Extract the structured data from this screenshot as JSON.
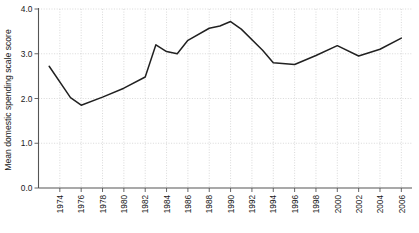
{
  "chart_data": {
    "type": "line",
    "title": "",
    "xlabel": "",
    "ylabel": "Mean domestic spending scale score",
    "ylim": [
      0.0,
      4.0
    ],
    "xlim": [
      1972,
      2007
    ],
    "grid": true,
    "legend": "none",
    "ytick_labels": [
      "0.0",
      "1.0",
      "2.0",
      "3.0",
      "4.0"
    ],
    "ytick_values": [
      0.0,
      1.0,
      2.0,
      3.0,
      4.0
    ],
    "xtick_labels": [
      "1974",
      "1976",
      "1978",
      "1980",
      "1982",
      "1984",
      "1986",
      "1988",
      "1990",
      "1992",
      "1994",
      "1996",
      "1998",
      "2000",
      "2002",
      "2004",
      "2006"
    ],
    "xtick_values": [
      1974,
      1976,
      1978,
      1980,
      1982,
      1984,
      1986,
      1988,
      1990,
      1992,
      1994,
      1996,
      1998,
      2000,
      2002,
      2004,
      2006
    ],
    "x": [
      1973,
      1975,
      1976,
      1978,
      1980,
      1982,
      1983,
      1984,
      1985,
      1986,
      1988,
      1989,
      1990,
      1991,
      1993,
      1994,
      1996,
      1998,
      2000,
      2002,
      2004,
      2006
    ],
    "series": [
      {
        "name": "Mean domestic spending scale score",
        "color": "#212121",
        "values": [
          2.72,
          2.02,
          1.85,
          2.03,
          2.23,
          2.48,
          3.2,
          3.05,
          3.0,
          3.3,
          3.57,
          3.62,
          3.72,
          3.55,
          3.08,
          2.8,
          2.76,
          2.96,
          3.18,
          2.95,
          3.1,
          3.35
        ]
      }
    ]
  }
}
